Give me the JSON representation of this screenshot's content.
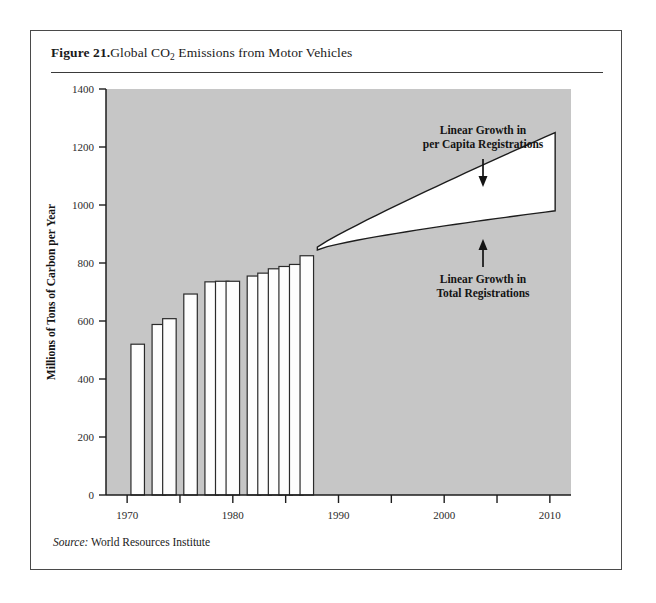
{
  "figure": {
    "number_label": "Figure 21.",
    "title_main": "Global  CO",
    "title_sub": "2",
    "title_rest": " Emissions from Motor Vehicles",
    "source_label": "Source:",
    "source_text": " World Resources Institute"
  },
  "colors": {
    "plot_background": "#c6c6c6",
    "bar_fill": "#fdfdfd",
    "bar_stroke": "#2a2a2a",
    "wedge_fill": "#ffffff",
    "wedge_stroke": "#1d1d1d",
    "axis": "#1d1d1d",
    "card_border": "#4a4a4a",
    "text": "#141414"
  },
  "chart_data": {
    "type": "bar",
    "title": "Global CO2 Emissions from Motor Vehicles",
    "xlabel": "",
    "ylabel": "Millions of Tons of Carbon per Year",
    "ylim": [
      0,
      1400
    ],
    "xlim": [
      1968,
      2012
    ],
    "yticks": [
      0,
      200,
      400,
      600,
      800,
      1000,
      1200,
      1400
    ],
    "ytick_labels": [
      "0",
      "200",
      "400",
      "600",
      "800",
      "1000",
      "1200",
      "1400"
    ],
    "xticks": [
      1970,
      1975,
      1980,
      1985,
      1990,
      1995,
      2000,
      2005,
      2010
    ],
    "xtick_labels": [
      "1970",
      "",
      "1980",
      "",
      "1990",
      "",
      "2000",
      "",
      "2010"
    ],
    "xtick_labeled": [
      1970,
      1980,
      1990,
      2000,
      2010
    ],
    "grid": false,
    "legend": "none",
    "categories": [
      1971,
      1973,
      1974,
      1976,
      1978,
      1979,
      1980,
      1982,
      1983,
      1984,
      1985,
      1986,
      1987
    ],
    "values": [
      520,
      588,
      608,
      693,
      735,
      737,
      737,
      755,
      765,
      780,
      788,
      795,
      825
    ],
    "series": [
      {
        "name": "CO2 emissions from motor vehicles",
        "values": [
          520,
          588,
          608,
          693,
          735,
          737,
          737,
          755,
          765,
          780,
          788,
          795,
          825
        ]
      }
    ],
    "projection": {
      "name": "Projected range",
      "x_start": 1988,
      "x_end": 2010.5,
      "upper_start": 855,
      "upper_end": 1250,
      "lower_start": 845,
      "lower_end": 980,
      "shape": "wedge"
    },
    "annotations": [
      {
        "id": "upper-bound",
        "line1": "Linear Growth in",
        "line2": "per Capita Registrations",
        "arrow": "down"
      },
      {
        "id": "lower-bound",
        "line1": "Linear Growth in",
        "line2": "Total Registrations",
        "arrow": "up"
      }
    ]
  }
}
